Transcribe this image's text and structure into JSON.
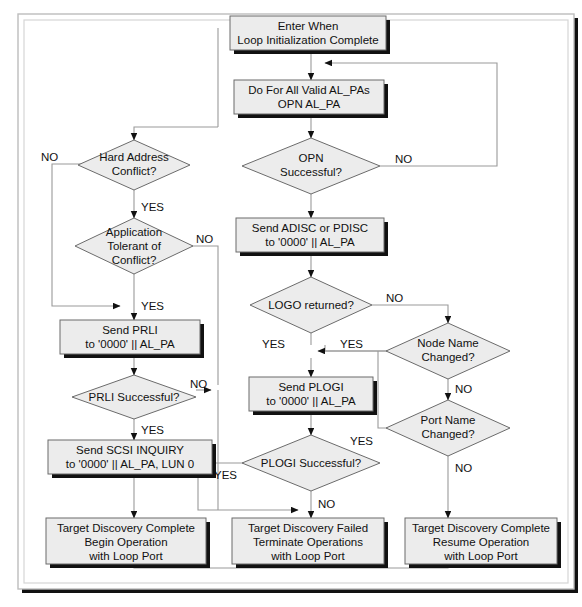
{
  "diagram": {
    "style": {
      "node_fill": "#ececec",
      "node_stroke": "#6b6b6b",
      "shadow": "#111111",
      "line": "#9a9a9a",
      "arrow": "#111111",
      "frame_outer": "#d9d9d9",
      "frame_inner": "#cfcfcf",
      "text": "#111111",
      "page_bg": "#ffffff"
    },
    "nodes": [
      {
        "id": "enter",
        "type": "process",
        "lines": [
          "Enter When",
          "Loop Initialization Complete"
        ]
      },
      {
        "id": "dofor",
        "type": "process",
        "lines": [
          "Do For All Valid AL_PAs",
          "OPN AL_PA"
        ]
      },
      {
        "id": "opn",
        "type": "decision",
        "lines": [
          "OPN",
          "Successful?"
        ]
      },
      {
        "id": "sendadisc",
        "type": "process",
        "lines": [
          "Send ADISC or PDISC",
          "to '0000' || AL_PA"
        ]
      },
      {
        "id": "logo",
        "type": "decision",
        "lines": [
          "LOGO returned?"
        ]
      },
      {
        "id": "sendplogi",
        "type": "process",
        "lines": [
          "Send PLOGI",
          "to '0000' || AL_PA"
        ]
      },
      {
        "id": "plogi",
        "type": "decision",
        "lines": [
          "PLOGI Successful?"
        ]
      },
      {
        "id": "hardaddr",
        "type": "decision",
        "lines": [
          "Hard Address",
          "Conflict?"
        ]
      },
      {
        "id": "apptol",
        "type": "decision",
        "lines": [
          "Application",
          "Tolerant of",
          "Conflict?"
        ]
      },
      {
        "id": "sendprli",
        "type": "process",
        "lines": [
          "Send PRLI",
          "to '0000' || AL_PA"
        ]
      },
      {
        "id": "prli",
        "type": "decision",
        "lines": [
          "PRLI Successful?"
        ]
      },
      {
        "id": "sendscsi",
        "type": "process",
        "lines": [
          "Send SCSI INQUIRY",
          "to '0000' || AL_PA, LUN 0"
        ]
      },
      {
        "id": "nodename",
        "type": "decision",
        "lines": [
          "Node Name",
          "Changed?"
        ]
      },
      {
        "id": "portname",
        "type": "decision",
        "lines": [
          "Port Name",
          "Changed?"
        ]
      },
      {
        "id": "endbegin",
        "type": "process",
        "lines": [
          "Target Discovery Complete",
          "Begin Operation",
          "with Loop Port"
        ]
      },
      {
        "id": "endfail",
        "type": "process",
        "lines": [
          "Target Discovery Failed",
          "Terminate Operations",
          "with Loop Port"
        ]
      },
      {
        "id": "endresume",
        "type": "process",
        "lines": [
          "Target Discovery Complete",
          "Resume Operation",
          "with Loop Port"
        ]
      }
    ],
    "edge_labels": {
      "opn_no": "NO",
      "logo_no": "NO",
      "logo_yes": "YES",
      "nodename_yes": "YES",
      "nodename_no": "NO",
      "portname_yes": "YES",
      "portname_no": "NO",
      "plogi_yes": "YES",
      "plogi_no": "NO",
      "hardaddr_no": "NO",
      "hardaddr_yes": "YES",
      "apptol_no": "NO",
      "apptol_yes": "YES",
      "prli_no": "NO",
      "prli_yes": "YES"
    }
  }
}
